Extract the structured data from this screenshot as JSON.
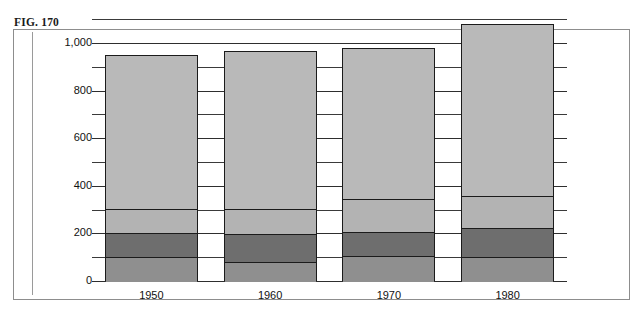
{
  "figure": {
    "label": "FIG. 170",
    "scan_remnant": "",
    "frame_color": "#8d8d8d"
  },
  "chart_data": {
    "type": "bar",
    "stacked": true,
    "title": "",
    "subtitle": "",
    "xlabel": "",
    "ylabel": "",
    "categories": [
      "1950",
      "1960",
      "1970",
      "1980"
    ],
    "ylim": [
      0,
      1100
    ],
    "ytick_values": [
      0,
      200,
      400,
      600,
      800,
      1000
    ],
    "ytick_labels": [
      "0",
      "200",
      "400",
      "600",
      "800",
      "1,000"
    ],
    "minor_tick_values": [
      100,
      300,
      500,
      700,
      900,
      1100
    ],
    "grid": true,
    "grid_axis": "y",
    "legend": "none",
    "totals": [
      950,
      965,
      980,
      1080
    ],
    "series": [
      {
        "name": "segment-1-bottom",
        "color": "#8f8f8f",
        "values": [
          105,
          85,
          110,
          105
        ]
      },
      {
        "name": "segment-2",
        "color": "#6e6e6e",
        "values": [
          100,
          115,
          100,
          120
        ]
      },
      {
        "name": "segment-3",
        "color": "#b3b3b3",
        "values": [
          100,
          105,
          140,
          135
        ]
      },
      {
        "name": "segment-4-top",
        "color": "#b9b9b9",
        "values": [
          645,
          660,
          630,
          720
        ]
      }
    ]
  }
}
